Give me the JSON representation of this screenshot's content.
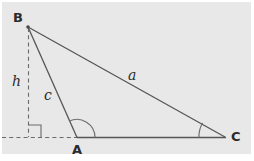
{
  "figure": {
    "background_color": "#e8e8e8",
    "stroke_color": "#555555",
    "label_color": "#2b2b2b",
    "vertices": {
      "B": {
        "label": "B",
        "x": 28,
        "y": 27
      },
      "A": {
        "label": "A",
        "x": 77,
        "y": 137
      },
      "C": {
        "label": "C",
        "x": 225,
        "y": 137
      }
    },
    "vertex_labels": [
      {
        "name": "vertex-label-b",
        "text": "B",
        "x": 13,
        "y": 11
      },
      {
        "name": "vertex-label-a",
        "text": "A",
        "x": 72,
        "y": 143
      },
      {
        "name": "vertex-label-c",
        "text": "C",
        "x": 231,
        "y": 130
      }
    ],
    "side_labels": [
      {
        "name": "side-label-a",
        "text": "a",
        "x": 128,
        "y": 68
      },
      {
        "name": "side-label-c",
        "text": "c",
        "x": 44,
        "y": 88
      },
      {
        "name": "altitude-label-h",
        "text": "h",
        "x": 12,
        "y": 74
      }
    ],
    "segments": [
      {
        "name": "segment-bc",
        "from": "B",
        "to": "C",
        "style": "solid"
      },
      {
        "name": "segment-ba",
        "from": "B",
        "to": "A",
        "style": "solid"
      },
      {
        "name": "segment-ac",
        "from": "A",
        "to": "C",
        "style": "solid"
      },
      {
        "name": "altitude-h",
        "from": "B",
        "to": "foot",
        "style": "dashed"
      },
      {
        "name": "baseline-extension",
        "from": "left-edge",
        "to": "A",
        "style": "dashed"
      }
    ],
    "markers": [
      {
        "name": "right-angle-marker",
        "type": "square",
        "at": "foot-of-altitude",
        "size": 12
      },
      {
        "name": "angle-arc-a",
        "type": "arc",
        "at": "A",
        "radius": 18,
        "classification": "obtuse"
      },
      {
        "name": "angle-arc-c",
        "type": "arc",
        "at": "C",
        "radius": 26,
        "classification": "acute"
      }
    ]
  }
}
